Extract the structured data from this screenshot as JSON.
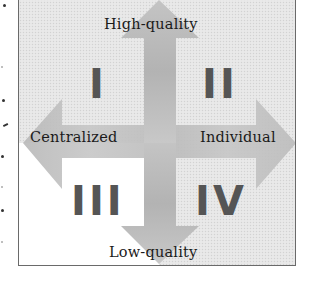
{
  "diagram": {
    "type": "quadrant-matrix",
    "axes": {
      "vertical": {
        "top_label": "High-quality",
        "bottom_label": "Low-quality"
      },
      "horizontal": {
        "left_label": "Centralized",
        "right_label": "Individual"
      }
    },
    "quadrants": [
      {
        "numeral": "I",
        "position": "top-left",
        "meaning": "High-quality / Centralized"
      },
      {
        "numeral": "II",
        "position": "top-right",
        "meaning": "High-quality / Individual"
      },
      {
        "numeral": "III",
        "position": "bottom-left",
        "meaning": "Low-quality / Centralized"
      },
      {
        "numeral": "IV",
        "position": "bottom-right",
        "meaning": "Low-quality / Individual"
      }
    ],
    "colors": {
      "quadrant_fill": "#e6e6e6",
      "quadrant_III_fill": "#ffffff",
      "arrow_fill": "#bdbdbd",
      "numeral_color": "#555555",
      "label_color": "#1a1a1a",
      "frame_color": "#6a6a6a"
    }
  }
}
